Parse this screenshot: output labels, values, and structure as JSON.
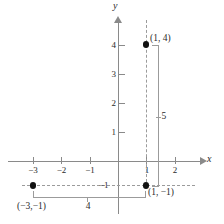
{
  "figure": {
    "kind": "cartesian-plane-distance-diagram",
    "axes": {
      "x_label": "x",
      "y_label": "y",
      "x_ticks": [
        {
          "value": "-3",
          "label": "−3"
        },
        {
          "value": "-2",
          "label": "−2"
        },
        {
          "value": "-1",
          "label": "−1"
        },
        {
          "value": "1",
          "label": "1"
        },
        {
          "value": "2",
          "label": "2"
        }
      ],
      "y_ticks": [
        {
          "value": "1",
          "label": "1"
        },
        {
          "value": "2",
          "label": "2"
        },
        {
          "value": "3",
          "label": "3"
        },
        {
          "value": "4",
          "label": "4"
        }
      ],
      "extra_labels": [
        {
          "name": "y-negative-one",
          "label": "−1"
        }
      ]
    },
    "points": [
      {
        "name": "point-1-4",
        "label": "(1, 4)",
        "x": "1",
        "y": "4"
      },
      {
        "name": "point-1-neg1",
        "label": "(1, −1)",
        "x": "1",
        "y": "-1"
      },
      {
        "name": "point-neg3-neg1",
        "label": "(−3,−1)",
        "x": "-3",
        "y": "-1"
      }
    ],
    "measurements": [
      {
        "name": "vertical-leg",
        "label": "5",
        "orientation": "vertical"
      },
      {
        "name": "horizontal-leg",
        "label": "4",
        "orientation": "horizontal"
      }
    ],
    "colors": {
      "axis": "#8a8a8a",
      "dashed_guide": "#9b9b9b",
      "point": "#111111",
      "text": "#2b2b2b",
      "background": "#ffffff"
    }
  }
}
